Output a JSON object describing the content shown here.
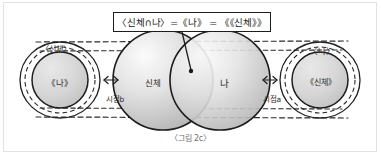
{
  "figure": {
    "caption": "〈그림 2c〉",
    "formula": {
      "box_label": "〈신체∩나〉=《나》 = 《《신체》》",
      "callout_target": "intersection-of-sinche-and-na"
    },
    "left_group": {
      "outer_label": "〈신체〉",
      "inner_label": "《나》"
    },
    "middle_group": {
      "left_circle_label": "신체",
      "right_circle_label": "나"
    },
    "right_group": {
      "outer_label": "〈나〉",
      "inner_label": "《신체》"
    },
    "viewpoints": {
      "left": "시점b",
      "right": "시점a"
    },
    "colors": {
      "ink": "#1d1d1d",
      "circle_fill_light": "#f2f2f2",
      "circle_fill_dark": "#b9b9b9",
      "caption_gray": "#6f6f6f",
      "frame_gray": "#e2e2e2",
      "paper": "#ffffff"
    }
  }
}
